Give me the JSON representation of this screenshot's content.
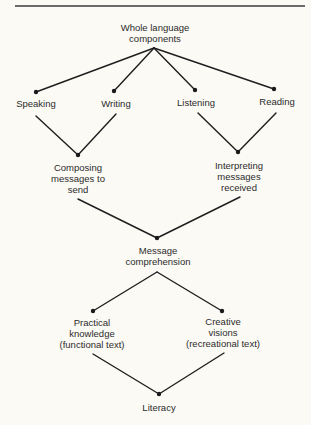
{
  "diagram": {
    "title_rule": true,
    "nodes": {
      "root": {
        "lines": [
          "Whole language",
          "components"
        ]
      },
      "speaking": {
        "lines": [
          "Speaking"
        ]
      },
      "writing": {
        "lines": [
          "Writing"
        ]
      },
      "listening": {
        "lines": [
          "Listening"
        ]
      },
      "reading": {
        "lines": [
          "Reading"
        ]
      },
      "composing": {
        "lines": [
          "Composing",
          "messages to",
          "send"
        ]
      },
      "interpreting": {
        "lines": [
          "Interpreting",
          "messages",
          "received"
        ]
      },
      "comprehension": {
        "lines": [
          "Message",
          "comprehension"
        ]
      },
      "practical": {
        "lines": [
          "Practical",
          "knowledge",
          "(functional text)"
        ]
      },
      "creative": {
        "lines": [
          "Creative",
          "visions",
          "(recreational text)"
        ]
      },
      "literacy": {
        "lines": [
          "Literacy"
        ]
      }
    },
    "edges": [
      [
        "root",
        "speaking"
      ],
      [
        "root",
        "writing"
      ],
      [
        "root",
        "listening"
      ],
      [
        "root",
        "reading"
      ],
      [
        "speaking",
        "composing"
      ],
      [
        "writing",
        "composing"
      ],
      [
        "listening",
        "interpreting"
      ],
      [
        "reading",
        "interpreting"
      ],
      [
        "composing",
        "comprehension"
      ],
      [
        "interpreting",
        "comprehension"
      ],
      [
        "comprehension",
        "practical"
      ],
      [
        "comprehension",
        "creative"
      ],
      [
        "practical",
        "literacy"
      ],
      [
        "creative",
        "literacy"
      ]
    ],
    "colors": {
      "background": "#fbfaf5",
      "line": "#1e1e1e",
      "text": "#2b2b2b"
    }
  }
}
